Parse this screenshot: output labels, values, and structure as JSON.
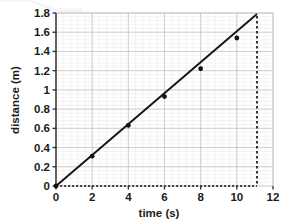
{
  "chart_data": {
    "type": "scatter",
    "title": "",
    "xlabel": "time (s)",
    "ylabel": "distance (m)",
    "xlim": [
      0,
      12
    ],
    "ylim": [
      0,
      1.8
    ],
    "grid": true,
    "minor_grid": true,
    "minor_grid_divisions": 5,
    "legend": "none",
    "x_ticks": [
      0,
      2,
      4,
      6,
      8,
      10,
      12
    ],
    "x_tick_labels": [
      "0",
      "2",
      "4",
      "6",
      "8",
      "10",
      "12"
    ],
    "y_ticks": [
      0,
      0.2,
      0.4,
      0.6,
      0.8,
      1,
      1.2,
      1.4,
      1.6,
      1.8
    ],
    "y_tick_labels": [
      "0",
      "0.2",
      "0.4",
      "0.6",
      "0.8",
      "1",
      "1.2",
      "1.4",
      "1.6",
      "1.8"
    ],
    "series": [
      {
        "name": "measured points",
        "type": "scatter",
        "marker": "filled-dot",
        "color": "#111111",
        "x": [
          0,
          2,
          4,
          6,
          8,
          10
        ],
        "y": [
          0,
          0.31,
          0.63,
          0.93,
          1.22,
          1.54
        ]
      },
      {
        "name": "best fit line",
        "type": "line",
        "color": "#111111",
        "x": [
          0,
          11.5
        ],
        "y": [
          0,
          1.8
        ]
      }
    ],
    "annotations": [
      {
        "name": "extrapolation-dashed-vertical",
        "type": "vertical-dashed-line",
        "x": 11.5,
        "y_from": 0,
        "y_to": 1.8,
        "color": "#111111"
      },
      {
        "name": "baseline-dashed-horizontal",
        "type": "horizontal-dashed-line",
        "y": 0,
        "x_from": 0,
        "x_to": 11.5,
        "color": "#111111"
      }
    ],
    "colors": {
      "data": "#111111",
      "major_grid": "#c8c8c8",
      "minor_grid": "#e4e4e4",
      "axis": "#4a4a4a",
      "background": "#ffffff"
    }
  }
}
